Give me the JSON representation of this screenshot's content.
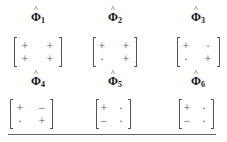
{
  "matrices": [
    {
      "label_base": "Φ",
      "label_sub": "1",
      "entries": [
        [
          "+",
          "+"
        ],
        [
          "+",
          "+"
        ]
      ]
    },
    {
      "label_base": "Φ",
      "label_sub": "2",
      "entries": [
        [
          "+",
          "+"
        ],
        [
          "·",
          "+"
        ]
      ]
    },
    {
      "label_base": "Φ",
      "label_sub": "3",
      "entries": [
        [
          "+",
          "·"
        ],
        [
          "·",
          "+"
        ]
      ]
    },
    {
      "label_base": "Φ",
      "label_sub": "4",
      "entries": [
        [
          "+",
          "−"
        ],
        [
          "·",
          "+"
        ]
      ]
    },
    {
      "label_base": "Φ",
      "label_sub": "5",
      "entries": [
        [
          "+",
          "·"
        ],
        [
          "−",
          "·"
        ]
      ]
    },
    {
      "label_base": "Φ",
      "label_sub": "6",
      "entries": [
        [
          "+",
          "·"
        ],
        [
          "−",
          "·"
        ]
      ]
    }
  ]
}
